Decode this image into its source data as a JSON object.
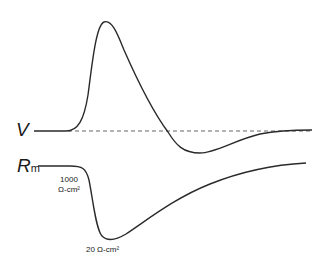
{
  "labels": {
    "voltage": "V",
    "resistance_main": "R",
    "resistance_sub": "m",
    "rest_resistance_value": "1000",
    "rest_resistance_unit": "Ω-cm²",
    "peak_resistance": "20 Ω-cm²"
  },
  "colors": {
    "trace": "#2a2a2a",
    "dashed": "#555555",
    "background": "#ffffff"
  }
}
